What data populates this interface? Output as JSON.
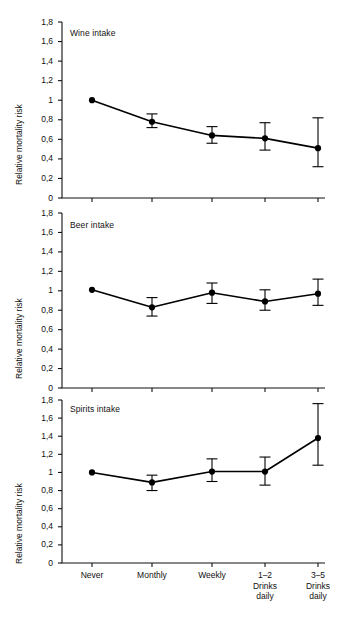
{
  "figure": {
    "axis_label_y": "Relative mortality risk",
    "y_ticks": [
      "1,8",
      "1,6",
      "1,4",
      "1,2",
      "1",
      "0,8",
      "0,6",
      "0,4",
      "0,2",
      "0"
    ],
    "x_tick_labels": [
      [
        "Never"
      ],
      [
        "Monthly"
      ],
      [
        "Weekly"
      ],
      [
        "1–2",
        "Drinks",
        "daily"
      ],
      [
        "3–5",
        "Drinks",
        "daily"
      ]
    ],
    "line_color": "#000000",
    "axis_color": "#111111",
    "background": "#ffffff"
  },
  "chart_data": [
    {
      "type": "line",
      "title": "Wine intake",
      "xlabel": "",
      "ylabel": "Relative mortality risk",
      "categories": [
        "Never",
        "Monthly",
        "Weekly",
        "1–2 Drinks daily",
        "3–5 Drinks daily"
      ],
      "values": [
        1.0,
        0.78,
        0.64,
        0.61,
        0.51
      ],
      "ci_lower": [
        1.0,
        0.72,
        0.56,
        0.49,
        0.32
      ],
      "ci_upper": [
        1.0,
        0.86,
        0.73,
        0.77,
        0.82
      ],
      "ylim": [
        0,
        1.8
      ],
      "ytick_step": 0.2,
      "grid": false,
      "legend": "none"
    },
    {
      "type": "line",
      "title": "Beer intake",
      "xlabel": "",
      "ylabel": "Relative mortality risk",
      "categories": [
        "Never",
        "Monthly",
        "Weekly",
        "1–2 Drinks daily",
        "3–5 Drinks daily"
      ],
      "values": [
        1.01,
        0.83,
        0.98,
        0.89,
        0.97
      ],
      "ci_lower": [
        1.01,
        0.74,
        0.87,
        0.8,
        0.85
      ],
      "ci_upper": [
        1.01,
        0.93,
        1.08,
        1.01,
        1.12
      ],
      "ylim": [
        0,
        1.8
      ],
      "ytick_step": 0.2,
      "grid": false,
      "legend": "none"
    },
    {
      "type": "line",
      "title": "Spirits intake",
      "xlabel": "",
      "ylabel": "Relative mortality risk",
      "categories": [
        "Never",
        "Monthly",
        "Weekly",
        "1–2 Drinks daily",
        "3–5 Drinks daily"
      ],
      "values": [
        1.0,
        0.89,
        1.01,
        1.01,
        1.38
      ],
      "ci_lower": [
        1.0,
        0.8,
        0.9,
        0.86,
        1.08
      ],
      "ci_upper": [
        1.0,
        0.97,
        1.15,
        1.17,
        1.76
      ],
      "ylim": [
        0,
        1.8
      ],
      "ytick_step": 0.2,
      "grid": false,
      "legend": "none"
    }
  ]
}
